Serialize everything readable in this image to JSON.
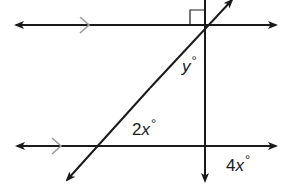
{
  "diagram": {
    "type": "geometry-parallel-lines-transversal",
    "colors": {
      "line": "#1a1a1a",
      "parallel_mark": "#9a9a9a",
      "background": "#ffffff"
    },
    "lines": {
      "top_parallel": {
        "parallel_mark": ">"
      },
      "bottom_parallel": {
        "parallel_mark": ">"
      },
      "vertical": {
        "perpendicular_to": "top_parallel",
        "right_angle_marker": true
      },
      "transversal": {}
    },
    "labels": {
      "y_angle": {
        "coef": "",
        "var": "y",
        "deg": "°"
      },
      "two_x_angle": {
        "coef": "2",
        "var": "x",
        "deg": "°"
      },
      "four_x_angle": {
        "coef": "4",
        "var": "x",
        "deg": "°"
      }
    }
  }
}
